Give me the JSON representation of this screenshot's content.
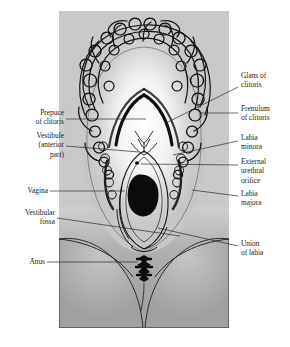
{
  "diagram": {
    "panel": {
      "background_color": "#c9c9c9",
      "skin_color": "#b3b3b3",
      "highlight_color": "#f2f2f2",
      "ink_color": "#111111"
    },
    "labels_left": [
      {
        "id": "prepuce-of-clitoris",
        "text": "Prepuce\nof clitoris"
      },
      {
        "id": "vestibule-anterior-part",
        "text": "Vestibule\n(anterior\npart)"
      },
      {
        "id": "vagina",
        "text": "Vagina"
      },
      {
        "id": "vestibular-fossa",
        "text": "Vestibular\nfossa"
      },
      {
        "id": "anus",
        "text": "Anus"
      }
    ],
    "labels_right": [
      {
        "id": "glans-of-clitoris",
        "text": "Glans of\nclitoris"
      },
      {
        "id": "frenulum-of-clitoris",
        "text": "Frenulum\nof clitoris"
      },
      {
        "id": "labia-minora",
        "text": "Labia\nminora"
      },
      {
        "id": "external-urethral-orifice",
        "text": "External\nurethral\norifice"
      },
      {
        "id": "labia-majora",
        "text": "Labia\nmajora"
      },
      {
        "id": "union-of-labia",
        "text": "Union\nof labia"
      }
    ],
    "structures": [
      {
        "id": "pubic-hair",
        "name": "pubic hair (mons pubis)"
      },
      {
        "id": "labia-majora-shape",
        "name": "labia majora"
      },
      {
        "id": "labia-minora-shape",
        "name": "labia minora"
      },
      {
        "id": "clitoral-hood",
        "name": "prepuce and glans of clitoris"
      },
      {
        "id": "urethral-orifice-dot",
        "name": "external urethral orifice"
      },
      {
        "id": "vaginal-orifice",
        "name": "vaginal orifice"
      },
      {
        "id": "anus-shape",
        "name": "anus"
      },
      {
        "id": "thigh-left",
        "name": "left thigh"
      },
      {
        "id": "thigh-right",
        "name": "right thigh"
      }
    ]
  }
}
